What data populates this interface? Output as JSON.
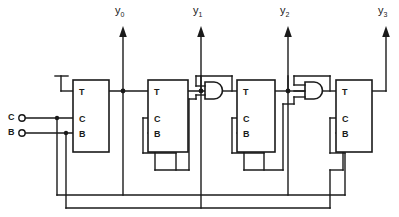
{
  "diagram": {
    "colors": {
      "line": "#1a1a1a",
      "background": "#ffffff"
    },
    "inputs": [
      {
        "name": "clock-input",
        "label": "C",
        "x": 10,
        "y": 118
      },
      {
        "name": "enable-input",
        "label": "B",
        "x": 10,
        "y": 133
      }
    ],
    "outputs": [
      {
        "name": "output-y0",
        "base": "y",
        "sub": "0",
        "x": 115,
        "y": 15
      },
      {
        "name": "output-y1",
        "base": "y",
        "sub": "1",
        "x": 193,
        "y": 15
      },
      {
        "name": "output-y2",
        "base": "y",
        "sub": "2",
        "x": 277,
        "y": 15
      },
      {
        "name": "output-y3",
        "base": "y",
        "sub": "3",
        "x": 376,
        "y": 15
      }
    ],
    "flipflops": [
      {
        "name": "flipflop-0",
        "t": "T",
        "c": "C",
        "b": "B",
        "x": 73,
        "y": 80,
        "w": 36,
        "h": 72
      },
      {
        "name": "flipflop-1",
        "t": "T",
        "c": "C",
        "b": "B",
        "x": 148,
        "y": 80,
        "w": 40,
        "h": 72
      },
      {
        "name": "flipflop-2",
        "t": "T",
        "c": "C",
        "b": "B",
        "x": 237,
        "y": 80,
        "w": 38,
        "h": 72
      },
      {
        "name": "flipflop-3",
        "t": "T",
        "c": "C",
        "b": "B",
        "x": 336,
        "y": 80,
        "w": 36,
        "h": 72
      }
    ],
    "gates": [
      {
        "name": "and-gate-1",
        "type": "AND",
        "inputs": 2,
        "x": 205,
        "y": 88
      },
      {
        "name": "and-gate-2",
        "type": "AND",
        "inputs": 3,
        "x": 305,
        "y": 88
      }
    ]
  }
}
